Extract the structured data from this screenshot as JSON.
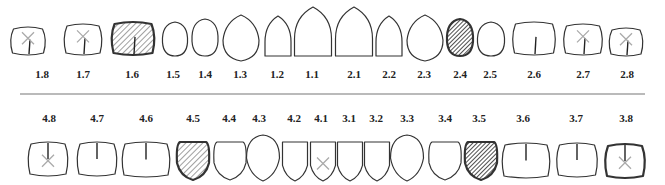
{
  "legend_colors": {
    "outline": "#333333",
    "hatch_light": "#888888",
    "hatch_dark": "#222222",
    "missing_mark": "#aaaaaa",
    "divider": "#777777"
  },
  "divider": {
    "y": 94,
    "x1": 20,
    "x2": 645
  },
  "upper": [
    {
      "id": "1.8",
      "cx": 28,
      "shape": "molar",
      "w": 37,
      "h": 28,
      "top": 27,
      "state": "missing",
      "fissure": true,
      "lx": 42
    },
    {
      "id": "1.7",
      "cx": 83,
      "shape": "molar",
      "w": 40,
      "h": 31,
      "top": 24,
      "state": "missing",
      "fissure": true,
      "lx": 83
    },
    {
      "id": "1.6",
      "cx": 133,
      "shape": "molar",
      "w": 45,
      "h": 33,
      "top": 22,
      "state": "crown_light",
      "fissure": true,
      "lx": 132
    },
    {
      "id": "1.5",
      "cx": 175,
      "shape": "premolar",
      "w": 25,
      "h": 34,
      "top": 22,
      "state": "healthy",
      "fissure": false,
      "lx": 173
    },
    {
      "id": "1.4",
      "cx": 205,
      "shape": "premolar",
      "w": 26,
      "h": 37,
      "top": 19,
      "state": "healthy",
      "fissure": false,
      "lx": 205
    },
    {
      "id": "1.3",
      "cx": 241,
      "shape": "canine",
      "w": 36,
      "h": 46,
      "top": 15,
      "state": "healthy",
      "fissure": false,
      "lx": 240
    },
    {
      "id": "1.2",
      "cx": 278,
      "shape": "incisor",
      "w": 26,
      "h": 40,
      "top": 16,
      "state": "healthy",
      "fissure": false,
      "lx": 277
    },
    {
      "id": "1.1",
      "cx": 313,
      "shape": "incisor",
      "w": 37,
      "h": 49,
      "top": 7,
      "state": "healthy",
      "fissure": false,
      "lx": 312
    },
    {
      "id": "2.1",
      "cx": 354,
      "shape": "incisor",
      "w": 37,
      "h": 49,
      "top": 7,
      "state": "healthy",
      "fissure": false,
      "lx": 354
    },
    {
      "id": "2.2",
      "cx": 389,
      "shape": "incisor",
      "w": 26,
      "h": 40,
      "top": 16,
      "state": "healthy",
      "fissure": false,
      "lx": 389
    },
    {
      "id": "2.3",
      "cx": 425,
      "shape": "canine",
      "w": 36,
      "h": 46,
      "top": 15,
      "state": "healthy",
      "fissure": false,
      "lx": 424
    },
    {
      "id": "2.4",
      "cx": 460,
      "shape": "premolar",
      "w": 26,
      "h": 37,
      "top": 19,
      "state": "crown_dark",
      "fissure": false,
      "lx": 460
    },
    {
      "id": "2.5",
      "cx": 491,
      "shape": "premolar",
      "w": 27,
      "h": 34,
      "top": 22,
      "state": "healthy",
      "fissure": false,
      "lx": 490
    },
    {
      "id": "2.6",
      "cx": 534,
      "shape": "molar",
      "w": 45,
      "h": 33,
      "top": 22,
      "state": "healthy",
      "fissure": true,
      "lx": 534
    },
    {
      "id": "2.7",
      "cx": 583,
      "shape": "molar",
      "w": 41,
      "h": 31,
      "top": 24,
      "state": "missing",
      "fissure": true,
      "lx": 583
    },
    {
      "id": "2.8",
      "cx": 626,
      "shape": "molar",
      "w": 36,
      "h": 28,
      "top": 28,
      "state": "missing",
      "fissure": true,
      "lx": 627
    }
  ],
  "lower": [
    {
      "id": "4.8",
      "cx": 48,
      "shape": "molar",
      "w": 42,
      "h": 34,
      "top": 142,
      "state": "missing",
      "fissure": true,
      "lx": 49
    },
    {
      "id": "4.7",
      "cx": 97,
      "shape": "molar",
      "w": 42,
      "h": 34,
      "top": 142,
      "state": "healthy",
      "fissure": true,
      "lx": 97
    },
    {
      "id": "4.6",
      "cx": 146,
      "shape": "molar",
      "w": 50,
      "h": 35,
      "top": 142,
      "state": "healthy",
      "fissure": true,
      "lx": 146
    },
    {
      "id": "4.5",
      "cx": 193,
      "shape": "lpremolar",
      "w": 32,
      "h": 38,
      "top": 142,
      "state": "crown_light",
      "fissure": false,
      "lx": 193
    },
    {
      "id": "4.4",
      "cx": 230,
      "shape": "lpremolar",
      "w": 32,
      "h": 38,
      "top": 142,
      "state": "healthy",
      "fissure": false,
      "lx": 229
    },
    {
      "id": "4.3",
      "cx": 263,
      "shape": "lcanine",
      "w": 33,
      "h": 46,
      "top": 135,
      "state": "healthy",
      "fissure": false,
      "lx": 259
    },
    {
      "id": "4.2",
      "cx": 295,
      "shape": "lincisor",
      "w": 25,
      "h": 39,
      "top": 142,
      "state": "healthy",
      "fissure": false,
      "lx": 294
    },
    {
      "id": "4.1",
      "cx": 323,
      "shape": "lincisor",
      "w": 25,
      "h": 39,
      "top": 142,
      "state": "missing",
      "fissure": false,
      "lx": 321
    },
    {
      "id": "3.1",
      "cx": 350,
      "shape": "lincisor",
      "w": 25,
      "h": 39,
      "top": 142,
      "state": "healthy",
      "fissure": false,
      "lx": 349
    },
    {
      "id": "3.2",
      "cx": 377,
      "shape": "lincisor",
      "w": 25,
      "h": 39,
      "top": 142,
      "state": "healthy",
      "fissure": false,
      "lx": 376
    },
    {
      "id": "3.3",
      "cx": 407,
      "shape": "lcanine",
      "w": 33,
      "h": 46,
      "top": 135,
      "state": "healthy",
      "fissure": false,
      "lx": 407
    },
    {
      "id": "3.4",
      "cx": 445,
      "shape": "lpremolar",
      "w": 32,
      "h": 38,
      "top": 142,
      "state": "healthy",
      "fissure": false,
      "lx": 445
    },
    {
      "id": "3.5",
      "cx": 481,
      "shape": "lpremolar",
      "w": 32,
      "h": 38,
      "top": 142,
      "state": "crown_dark",
      "fissure": false,
      "lx": 479
    },
    {
      "id": "3.6",
      "cx": 526,
      "shape": "molar",
      "w": 50,
      "h": 35,
      "top": 143,
      "state": "healthy",
      "fissure": true,
      "lx": 523
    },
    {
      "id": "3.7",
      "cx": 577,
      "shape": "molar",
      "w": 43,
      "h": 34,
      "top": 143,
      "state": "healthy",
      "fissure": true,
      "lx": 576
    },
    {
      "id": "3.8",
      "cx": 625,
      "shape": "molar",
      "w": 42,
      "h": 34,
      "top": 144,
      "state": "missing_thick",
      "fissure": true,
      "lx": 626
    }
  ],
  "upper_label_y": 78,
  "lower_label_y": 122
}
